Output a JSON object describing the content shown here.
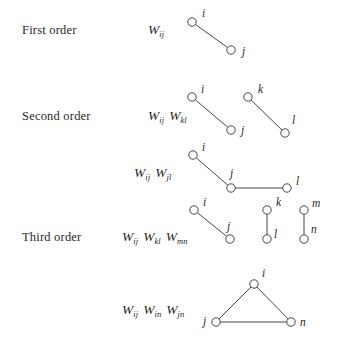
{
  "figure": {
    "background_color": "#ffffff",
    "ink_color": "#2b2724",
    "edge_color": "#4a4644",
    "width": 343,
    "height": 342
  },
  "rows": [
    {
      "id": "first-order",
      "label": "First order",
      "label_x": 22,
      "label_y": 32,
      "show_label": true,
      "formula": [
        {
          "sym": "W",
          "sub": "ij"
        }
      ],
      "formula_x": 148,
      "formula_y": 32,
      "diagrams": [
        {
          "id": "first-order-edge-ij",
          "nodes": [
            {
              "name": "i",
              "cx": 192,
              "cy": 22,
              "lx": 202,
              "ly": 17
            },
            {
              "name": "j",
              "cx": 231,
              "cy": 50,
              "lx": 242,
              "ly": 55
            }
          ],
          "edges": [
            {
              "from": 0,
              "to": 1
            }
          ]
        }
      ]
    },
    {
      "id": "second-order-a",
      "label": "Second order",
      "label_x": 22,
      "label_y": 118,
      "show_label": true,
      "formula": [
        {
          "sym": "W",
          "sub": "ij"
        },
        {
          "sym": "W",
          "sub": "kl"
        }
      ],
      "formula_x": 148,
      "formula_y": 118,
      "diagrams": [
        {
          "id": "second-order-edge-ij",
          "nodes": [
            {
              "name": "i",
              "cx": 192,
              "cy": 97,
              "lx": 201,
              "ly": 93
            },
            {
              "name": "j",
              "cx": 231,
              "cy": 130,
              "lx": 241,
              "ly": 134
            }
          ],
          "edges": [
            {
              "from": 0,
              "to": 1
            }
          ]
        },
        {
          "id": "second-order-edge-kl",
          "nodes": [
            {
              "name": "k",
              "cx": 248,
              "cy": 97,
              "lx": 258,
              "ly": 93
            },
            {
              "name": "l",
              "cx": 285,
              "cy": 133,
              "lx": 292,
              "ly": 124
            }
          ],
          "edges": [
            {
              "from": 0,
              "to": 1
            }
          ]
        }
      ]
    },
    {
      "id": "second-order-b",
      "label": "",
      "label_x": 22,
      "label_y": 175,
      "show_label": false,
      "formula": [
        {
          "sym": "W",
          "sub": "ij"
        },
        {
          "sym": "W",
          "sub": "jl"
        }
      ],
      "formula_x": 134,
      "formula_y": 175,
      "diagrams": [
        {
          "id": "second-order-path-ijl",
          "nodes": [
            {
              "name": "i",
              "cx": 193,
              "cy": 155,
              "lx": 202,
              "ly": 151
            },
            {
              "name": "j",
              "cx": 231,
              "cy": 188,
              "lx": 230,
              "ly": 177
            },
            {
              "name": "l",
              "cx": 287,
              "cy": 188,
              "lx": 296,
              "ly": 185
            }
          ],
          "edges": [
            {
              "from": 0,
              "to": 1
            },
            {
              "from": 1,
              "to": 2
            }
          ]
        }
      ]
    },
    {
      "id": "third-order-a",
      "label": "Third order",
      "label_x": 22,
      "label_y": 239,
      "show_label": true,
      "formula": [
        {
          "sym": "W",
          "sub": "ij"
        },
        {
          "sym": "W",
          "sub": "kl"
        },
        {
          "sym": "W",
          "sub": "mn"
        }
      ],
      "formula_x": 122,
      "formula_y": 239,
      "diagrams": [
        {
          "id": "third-order-edge-ij",
          "nodes": [
            {
              "name": "i",
              "cx": 194,
              "cy": 210,
              "lx": 203,
              "ly": 206
            },
            {
              "name": "j",
              "cx": 230,
              "cy": 239,
              "lx": 227,
              "ly": 230
            }
          ],
          "edges": [
            {
              "from": 0,
              "to": 1
            }
          ]
        },
        {
          "id": "third-order-edge-kl",
          "nodes": [
            {
              "name": "k",
              "cx": 267,
              "cy": 210,
              "lx": 276,
              "ly": 206
            },
            {
              "name": "l",
              "cx": 267,
              "cy": 239,
              "lx": 274,
              "ly": 238
            }
          ],
          "edges": [
            {
              "from": 0,
              "to": 1
            }
          ]
        },
        {
          "id": "third-order-edge-mn",
          "nodes": [
            {
              "name": "m",
              "cx": 304,
              "cy": 210,
              "lx": 312,
              "ly": 207
            },
            {
              "name": "n",
              "cx": 304,
              "cy": 239,
              "lx": 311,
              "ly": 233
            }
          ],
          "edges": [
            {
              "from": 0,
              "to": 1
            }
          ]
        }
      ]
    },
    {
      "id": "third-order-b",
      "label": "",
      "label_x": 22,
      "label_y": 312,
      "show_label": false,
      "formula": [
        {
          "sym": "W",
          "sub": "ij"
        },
        {
          "sym": "W",
          "sub": "in"
        },
        {
          "sym": "W",
          "sub": "jn"
        }
      ],
      "formula_x": 122,
      "formula_y": 312,
      "diagrams": [
        {
          "id": "third-order-triangle-ijn",
          "nodes": [
            {
              "name": "i",
              "cx": 254,
              "cy": 284,
              "lx": 262,
              "ly": 277
            },
            {
              "name": "j",
              "cx": 216,
              "cy": 322,
              "lx": 203,
              "ly": 325
            },
            {
              "name": "n",
              "cx": 291,
              "cy": 322,
              "lx": 300,
              "ly": 326
            }
          ],
          "edges": [
            {
              "from": 0,
              "to": 1
            },
            {
              "from": 1,
              "to": 2
            },
            {
              "from": 2,
              "to": 0
            }
          ]
        }
      ]
    }
  ],
  "node_radius": 4.2
}
